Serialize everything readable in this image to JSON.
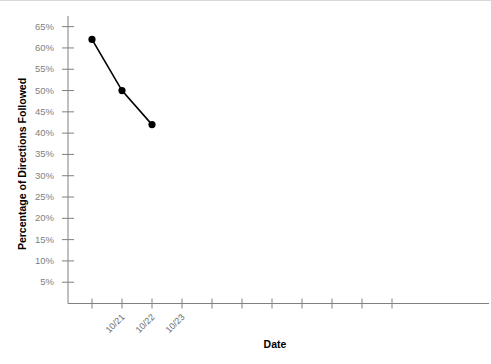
{
  "chart_data": {
    "type": "line",
    "title": "",
    "xlabel": "Date",
    "ylabel": "Percentage of Directions Followed",
    "categories": [
      "10/21",
      "10/22",
      "10/23"
    ],
    "values": [
      62,
      50,
      42
    ],
    "series": [
      {
        "name": "Percentage of Directions Followed",
        "values": [
          62,
          50,
          42
        ]
      }
    ],
    "ylim": [
      0,
      67.5
    ],
    "ytick_values": [
      5,
      10,
      15,
      20,
      25,
      30,
      35,
      40,
      45,
      50,
      55,
      60,
      65
    ],
    "ytick_labels": [
      "5%",
      "10%",
      "15%",
      "20%",
      "25%",
      "30%",
      "35%",
      "40%",
      "45%",
      "50%",
      "55%",
      "60%",
      "65%"
    ],
    "xtick_count": 11,
    "xtick_labels": [
      "10/21",
      "10/22",
      "10/23",
      "",
      "",
      "",
      "",
      "",
      "",
      "",
      ""
    ],
    "grid": false,
    "legend": false,
    "legend_position": "none",
    "marker": "circle",
    "line_color": "#000000",
    "marker_color": "#000000",
    "axis_color": "#808080",
    "tick_label_color": "#808080",
    "axis_title_color": "#000000",
    "background_color": "#ffffff"
  }
}
